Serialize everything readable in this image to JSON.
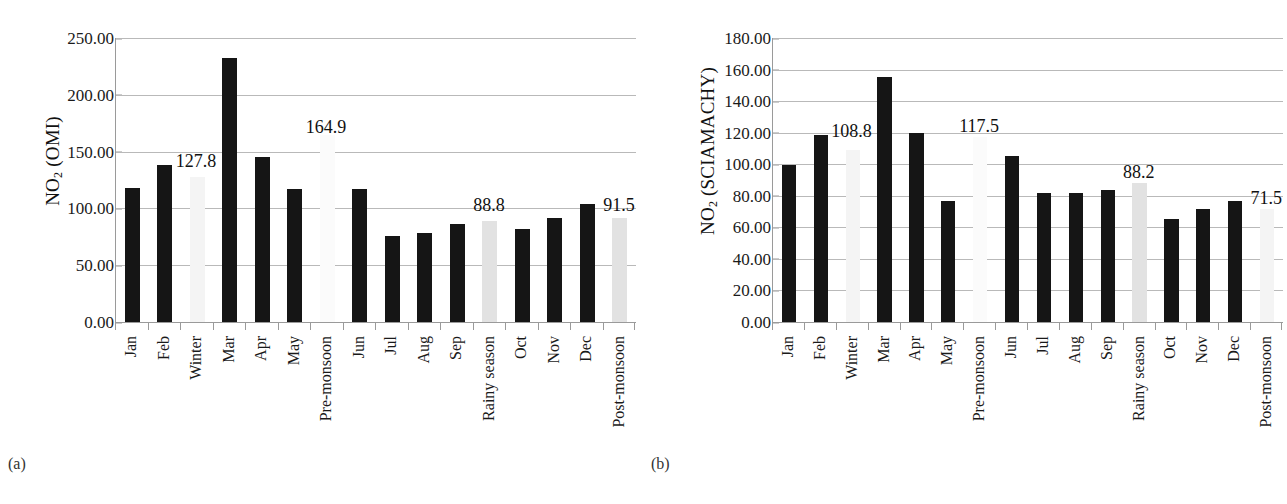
{
  "figure": {
    "panels": [
      {
        "caption": "(a)",
        "ylabel_main": "NO",
        "ylabel_sub": "2",
        "ylabel_paren": " (OMI)",
        "ylabel_full": "NO2 (OMI)"
      },
      {
        "caption": "(b)",
        "ylabel_main": "NO",
        "ylabel_sub": "2",
        "ylabel_paren": " (SCIAMACHY)",
        "ylabel_full": "NO2 (SCIAMACHY)"
      }
    ]
  },
  "colors": {
    "bar_dark": "#151515",
    "bar_light": "#e2e2e2",
    "bar_faint": "#f4f4f4",
    "bar_ghost": "#fbfbfb",
    "gridline": "#b9b9b9",
    "axis": "#9a9a9a",
    "text": "#1a1a1a",
    "background": "#ffffff"
  },
  "chart_data": [
    {
      "type": "bar",
      "title": "",
      "panel": "(a)",
      "xlabel": "",
      "ylabel": "NO2 (OMI)",
      "ylim": [
        0,
        250
      ],
      "ytick_step": 50,
      "ytick_labels": [
        "250.00",
        "200.00",
        "150.00",
        "100.00",
        "50.00",
        "0.00"
      ],
      "ytick_values": [
        250,
        200,
        150,
        100,
        50,
        0
      ],
      "grid": true,
      "legend": "none",
      "categories": [
        "Jan",
        "Feb",
        "Winter",
        "Mar",
        "Apr",
        "May",
        "Pre-monsoon",
        "Jun",
        "Jul",
        "Aug",
        "Sep",
        "Rainy season",
        "Oct",
        "Nov",
        "Dec",
        "Post-monsoon"
      ],
      "values": [
        118.0,
        138.0,
        127.8,
        232.0,
        145.0,
        117.0,
        164.9,
        117.0,
        76.0,
        78.0,
        86.0,
        88.8,
        82.0,
        92.0,
        104.0,
        91.5
      ],
      "bar_styles": [
        "dark",
        "dark",
        "faint",
        "dark",
        "dark",
        "dark",
        "ghost",
        "dark",
        "dark",
        "dark",
        "dark",
        "light",
        "dark",
        "dark",
        "dark",
        "light"
      ],
      "annotations": [
        {
          "text": "127.8",
          "category": "Winter",
          "value": 127.8,
          "x_pct": 15.6,
          "y_value": 150
        },
        {
          "text": "164.9",
          "category": "Pre-monsoon",
          "value": 164.9,
          "x_pct": 40.6,
          "y_value": 180
        },
        {
          "text": "88.8",
          "category": "Rainy season",
          "value": 88.8,
          "x_pct": 71.9,
          "y_value": 111
        },
        {
          "text": "91.5",
          "category": "Post-monsoon",
          "value": 91.5,
          "x_pct": 96.9,
          "y_value": 111
        }
      ]
    },
    {
      "type": "bar",
      "title": "",
      "panel": "(b)",
      "xlabel": "",
      "ylabel": "NO2 (SCIAMACHY)",
      "ylim": [
        0,
        180
      ],
      "ytick_step": 20,
      "ytick_labels": [
        "180.00",
        "160.00",
        "140.00",
        "120.00",
        "100.00",
        "80.00",
        "60.00",
        "40.00",
        "20.00",
        "0.00"
      ],
      "ytick_values": [
        180,
        160,
        140,
        120,
        100,
        80,
        60,
        40,
        20,
        0
      ],
      "grid": true,
      "legend": "none",
      "categories": [
        "Jan",
        "Feb",
        "Winter",
        "Mar",
        "Apr",
        "May",
        "Pre-monsoon",
        "Jun",
        "Jul",
        "Aug",
        "Sep",
        "Rainy season",
        "Oct",
        "Nov",
        "Dec",
        "Post-monsoon"
      ],
      "values": [
        99.5,
        118.5,
        108.8,
        155.0,
        120.0,
        77.0,
        117.5,
        105.0,
        82.0,
        82.0,
        83.5,
        88.2,
        65.5,
        71.5,
        77.0,
        71.5
      ],
      "bar_styles": [
        "dark",
        "dark",
        "faint",
        "dark",
        "dark",
        "dark",
        "ghost",
        "dark",
        "dark",
        "dark",
        "dark",
        "light",
        "dark",
        "dark",
        "dark",
        "faint"
      ],
      "annotations": [
        {
          "text": "108.8",
          "category": "Winter",
          "value": 108.8,
          "x_pct": 15.6,
          "y_value": 127
        },
        {
          "text": "117.5",
          "category": "Pre-monsoon",
          "value": 117.5,
          "x_pct": 40.6,
          "y_value": 130
        },
        {
          "text": "88.2",
          "category": "Rainy season",
          "value": 88.2,
          "x_pct": 71.9,
          "y_value": 101
        },
        {
          "text": "71.5",
          "category": "Post-monsoon",
          "value": 71.5,
          "x_pct": 96.9,
          "y_value": 84
        }
      ]
    }
  ]
}
